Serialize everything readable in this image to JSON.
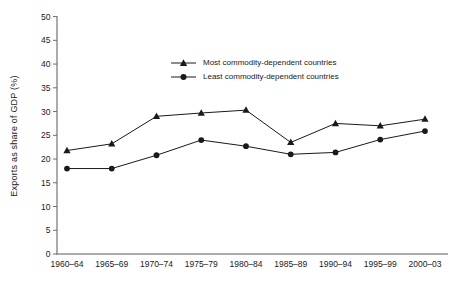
{
  "chart_data": {
    "type": "line",
    "title": "",
    "xlabel": "",
    "ylabel": "Exports as share of GDP (%)",
    "ylim": [
      0,
      50
    ],
    "ytick_step": 5,
    "grid": false,
    "legend_position": "inside-top-center",
    "categories": [
      "1960–64",
      "1965–69",
      "1970–74",
      "1975–79",
      "1980–84",
      "1985–89",
      "1990–94",
      "1995–99",
      "2000–03"
    ],
    "series": [
      {
        "name": "Most commodity-dependent countries",
        "marker": "triangle",
        "color": "#1a1a1a",
        "values": [
          21.8,
          23.2,
          29.0,
          29.7,
          30.3,
          23.5,
          27.5,
          27.0,
          28.4
        ]
      },
      {
        "name": "Least commodity-dependent countries",
        "marker": "circle",
        "color": "#1a1a1a",
        "values": [
          18.0,
          18.0,
          20.8,
          24.0,
          22.7,
          21.0,
          21.4,
          24.1,
          25.9
        ]
      }
    ],
    "colors": {
      "axis": "#8f8f8f",
      "tick": "#6e6e6e",
      "text": "#1a1a1a",
      "background": "#ffffff"
    }
  }
}
